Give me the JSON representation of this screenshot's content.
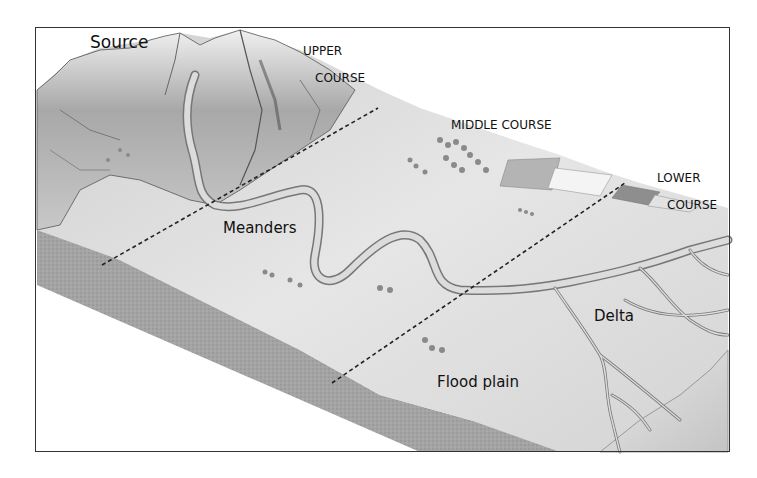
{
  "diagram": {
    "labels": {
      "source": "Source",
      "upper_course": [
        "UPPER",
        "COURSE"
      ],
      "middle_course": "MIDDLE COURSE",
      "lower_course": [
        "LOWER",
        "COURSE"
      ],
      "meanders": "Meanders",
      "delta": "Delta",
      "flood_plain": "Flood plain"
    },
    "colors": {
      "frame": "#333333",
      "land_light": "#e4e4e4",
      "land_mid": "#c8c8c8",
      "mountain_dark": "#6e6e6e",
      "river": "#d8d8d8",
      "river_bank": "#777777",
      "cross_section": "#9a9a9a",
      "sea": "#dadada",
      "text": "#111111"
    },
    "section_dividers": 3
  }
}
